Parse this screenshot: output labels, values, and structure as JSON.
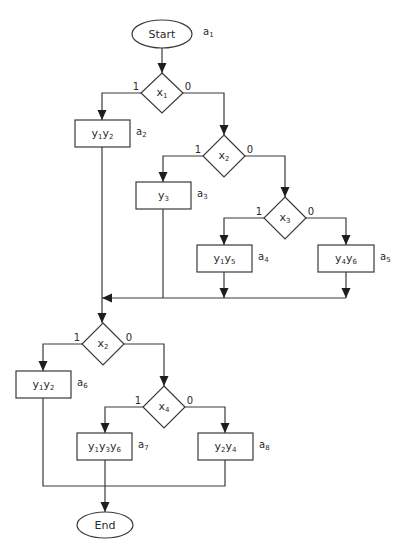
{
  "diagram": {
    "type": "flowchart",
    "title_fragment": "",
    "colors": {
      "stroke": "#3a3a3a",
      "arrow": "#1e1e1e",
      "background": "#ffffff",
      "text": "#2a2a2a"
    },
    "terminals": [
      {
        "id": "start",
        "label": "Start",
        "state": "a1",
        "cx": 162,
        "cy": 34,
        "rx": 30,
        "ry": 14
      },
      {
        "id": "end",
        "label": "End",
        "state": "",
        "cx": 105,
        "cy": 525,
        "rx": 28,
        "ry": 13
      }
    ],
    "decisions": [
      {
        "id": "d1",
        "var": "x",
        "sub": "1",
        "cx": 162,
        "cy": 93,
        "hw": 21,
        "hh": 20,
        "yes": "1",
        "no": "0"
      },
      {
        "id": "d2",
        "var": "x",
        "sub": "2",
        "cx": 224,
        "cy": 156,
        "hw": 21,
        "hh": 21,
        "yes": "1",
        "no": "0"
      },
      {
        "id": "d3",
        "var": "x",
        "sub": "3",
        "cx": 285,
        "cy": 218,
        "hw": 21,
        "hh": 21,
        "yes": "1",
        "no": "0"
      },
      {
        "id": "d4",
        "var": "x",
        "sub": "2",
        "cx": 103,
        "cy": 344,
        "hw": 21,
        "hh": 21,
        "yes": "1",
        "no": "0"
      },
      {
        "id": "d5",
        "var": "x",
        "sub": "4",
        "cx": 164,
        "cy": 407,
        "hw": 21,
        "hh": 21,
        "yes": "1",
        "no": "0"
      }
    ],
    "operations": [
      {
        "id": "op_a2",
        "outputs": [
          [
            "y",
            "1"
          ],
          [
            "y",
            "2"
          ]
        ],
        "state": "a",
        "state_sub": "2",
        "x": 75,
        "y": 120,
        "w": 55,
        "h": 27
      },
      {
        "id": "op_a3",
        "outputs": [
          [
            "y",
            "3"
          ]
        ],
        "state": "a",
        "state_sub": "3",
        "x": 136,
        "y": 182,
        "w": 55,
        "h": 27
      },
      {
        "id": "op_a4",
        "outputs": [
          [
            "y",
            "1"
          ],
          [
            "y",
            "5"
          ]
        ],
        "state": "a",
        "state_sub": "4",
        "x": 197,
        "y": 245,
        "w": 55,
        "h": 27
      },
      {
        "id": "op_a5",
        "outputs": [
          [
            "y",
            "4"
          ],
          [
            "y",
            "6"
          ]
        ],
        "state": "a",
        "state_sub": "5",
        "x": 318,
        "y": 245,
        "w": 56,
        "h": 27
      },
      {
        "id": "op_a6",
        "outputs": [
          [
            "y",
            "1"
          ],
          [
            "y",
            "2"
          ]
        ],
        "state": "a",
        "state_sub": "6",
        "x": 16,
        "y": 371,
        "w": 55,
        "h": 27
      },
      {
        "id": "op_a7",
        "outputs": [
          [
            "y",
            "1"
          ],
          [
            "y",
            "3"
          ],
          [
            "y",
            "6"
          ]
        ],
        "state": "a",
        "state_sub": "7",
        "x": 77,
        "y": 433,
        "w": 55,
        "h": 27
      },
      {
        "id": "op_a8",
        "outputs": [
          [
            "y",
            "2"
          ],
          [
            "y",
            "4"
          ]
        ],
        "state": "a",
        "state_sub": "8",
        "x": 198,
        "y": 433,
        "w": 55,
        "h": 27
      }
    ],
    "start_state": {
      "var": "a",
      "sub": "1"
    },
    "edges": [
      {
        "points": [
          [
            162,
            48
          ],
          [
            162,
            73
          ]
        ],
        "arrow": true
      },
      {
        "points": [
          [
            141,
            93
          ],
          [
            102,
            93
          ],
          [
            102,
            120
          ]
        ],
        "arrow": true
      },
      {
        "points": [
          [
            183,
            93
          ],
          [
            224,
            93
          ],
          [
            224,
            135
          ]
        ],
        "arrow": true
      },
      {
        "points": [
          [
            203,
            156
          ],
          [
            163,
            156
          ],
          [
            163,
            182
          ]
        ],
        "arrow": true
      },
      {
        "points": [
          [
            245,
            156
          ],
          [
            285,
            156
          ],
          [
            285,
            197
          ]
        ],
        "arrow": true
      },
      {
        "points": [
          [
            264,
            218
          ],
          [
            224,
            218
          ],
          [
            224,
            245
          ]
        ],
        "arrow": true
      },
      {
        "points": [
          [
            306,
            218
          ],
          [
            346,
            218
          ],
          [
            346,
            245
          ]
        ],
        "arrow": true
      },
      {
        "points": [
          [
            224,
            272
          ],
          [
            224,
            298
          ]
        ],
        "arrow": true
      },
      {
        "points": [
          [
            346,
            272
          ],
          [
            346,
            298
          ]
        ],
        "arrow": true
      },
      {
        "points": [
          [
            346,
            298
          ],
          [
            102,
            298
          ]
        ],
        "arrow": true
      },
      {
        "points": [
          [
            163,
            209
          ],
          [
            163,
            298
          ]
        ],
        "arrow": false
      },
      {
        "points": [
          [
            102,
            147
          ],
          [
            102,
            323
          ]
        ],
        "arrow": true
      },
      {
        "points": [
          [
            82,
            344
          ],
          [
            43,
            344
          ],
          [
            43,
            371
          ]
        ],
        "arrow": true
      },
      {
        "points": [
          [
            124,
            344
          ],
          [
            164,
            344
          ],
          [
            164,
            386
          ]
        ],
        "arrow": true
      },
      {
        "points": [
          [
            143,
            407
          ],
          [
            105,
            407
          ],
          [
            105,
            433
          ]
        ],
        "arrow": true
      },
      {
        "points": [
          [
            185,
            407
          ],
          [
            225,
            407
          ],
          [
            225,
            433
          ]
        ],
        "arrow": true
      },
      {
        "points": [
          [
            43,
            398
          ],
          [
            43,
            486
          ],
          [
            225,
            486
          ],
          [
            225,
            460
          ]
        ],
        "arrow": false
      },
      {
        "points": [
          [
            105,
            460
          ],
          [
            105,
            512
          ]
        ],
        "arrow": true
      }
    ]
  }
}
